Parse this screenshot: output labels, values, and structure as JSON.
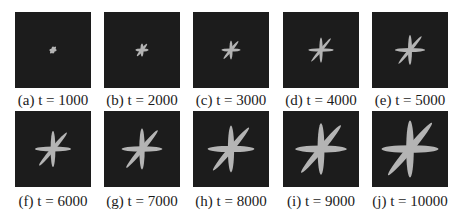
{
  "figure": {
    "petal_color": "#b4b4b4",
    "background_color": "#1c1c1c",
    "panels": [
      {
        "label": "(a) t = 1000",
        "t": 1000,
        "scale": 0.12
      },
      {
        "label": "(b) t = 2000",
        "t": 2000,
        "scale": 0.22
      },
      {
        "label": "(c) t = 3000",
        "t": 3000,
        "scale": 0.32
      },
      {
        "label": "(d) t = 4000",
        "t": 4000,
        "scale": 0.42
      },
      {
        "label": "(e) t = 5000",
        "t": 5000,
        "scale": 0.5
      },
      {
        "label": "(f) t = 6000",
        "t": 6000,
        "scale": 0.6
      },
      {
        "label": "(g) t = 7000",
        "t": 7000,
        "scale": 0.68
      },
      {
        "label": "(h) t = 8000",
        "t": 8000,
        "scale": 0.78
      },
      {
        "label": "(i) t = 9000",
        "t": 9000,
        "scale": 0.86
      },
      {
        "label": "(j) t = 10000",
        "t": 10000,
        "scale": 0.95
      }
    ]
  }
}
